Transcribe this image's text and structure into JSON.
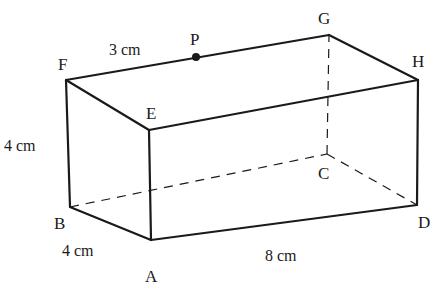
{
  "figure": {
    "type": "cuboid",
    "vertices": {
      "A": {
        "label": "A",
        "x": 151,
        "y": 240
      },
      "B": {
        "label": "B",
        "x": 70,
        "y": 207
      },
      "C": {
        "label": "C",
        "x": 327,
        "y": 154
      },
      "D": {
        "label": "D",
        "x": 417,
        "y": 205
      },
      "E": {
        "label": "E",
        "x": 149,
        "y": 130
      },
      "F": {
        "label": "F",
        "x": 66,
        "y": 80
      },
      "G": {
        "label": "G",
        "x": 329,
        "y": 35
      },
      "H": {
        "label": "H",
        "x": 418,
        "y": 80
      }
    },
    "point": {
      "label": "P",
      "x": 196,
      "y": 57,
      "on_edge": "FG"
    },
    "measurements": {
      "fp": "3 cm",
      "height": "4 cm",
      "width": "4 cm",
      "length": "8 cm"
    },
    "hidden_edges": [
      "BC",
      "CD",
      "CG"
    ],
    "colors": {
      "stroke": "#1a1a1a",
      "background": "#ffffff"
    }
  }
}
